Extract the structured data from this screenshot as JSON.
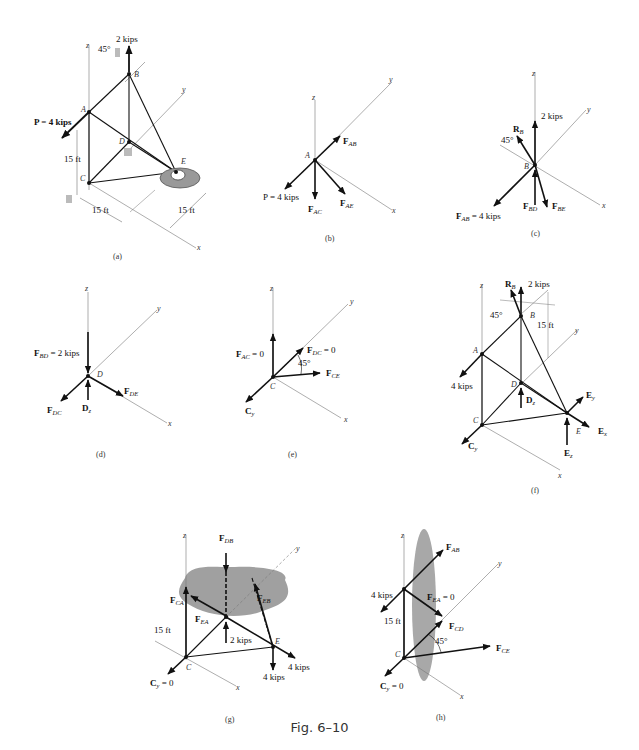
{
  "figure": {
    "caption": "Fig. 6–10",
    "panels": [
      {
        "id": "a",
        "label": "(a)",
        "elements": {
          "load_top": "2 kips",
          "angle": "45°",
          "load_P": "P = 4 kips",
          "dim_height": "15 ft",
          "dim_x": "15 ft",
          "dim_y": "15 ft",
          "joints": [
            "A",
            "B",
            "C",
            "D",
            "E"
          ],
          "axes": [
            "x",
            "y",
            "z"
          ]
        }
      },
      {
        "id": "b",
        "label": "(b)",
        "elements": {
          "joint": "A",
          "forces": [
            "F_AB",
            "F_AC",
            "F_AE"
          ],
          "load": "P = 4 kips"
        }
      },
      {
        "id": "c",
        "label": "(c)",
        "elements": {
          "joint": "B",
          "load": "2 kips",
          "reaction": "R_B",
          "angle": "45°",
          "forces": [
            "F_AB = 4 kips",
            "F_BD",
            "F_BE"
          ]
        }
      },
      {
        "id": "d",
        "label": "(d)",
        "elements": {
          "joint": "D",
          "forces": [
            "F_BD = 2 kips",
            "F_DC",
            "F_DE"
          ],
          "reaction": "D_z"
        }
      },
      {
        "id": "e",
        "label": "(e)",
        "elements": {
          "joint": "C",
          "forces": [
            "F_AC = 0",
            "F_DC = 0",
            "F_CE"
          ],
          "angle": "45°",
          "reaction": "C_y"
        }
      },
      {
        "id": "f",
        "label": "(f)",
        "elements": {
          "load_top": "2 kips",
          "reaction_B": "R_B",
          "angle": "45°",
          "dim": "15 ft",
          "load_A": "4 kips",
          "reactions": [
            "D_z",
            "C_y",
            "E_x",
            "E_y",
            "E_z"
          ]
        }
      },
      {
        "id": "g",
        "label": "(g)",
        "elements": {
          "forces": [
            "F_DB",
            "F_CA",
            "F_EB",
            "F_EA"
          ],
          "loads": [
            "2 kips",
            "4 kips",
            "4 kips"
          ],
          "dim": "15 ft",
          "reaction": "C_y = 0",
          "joints": [
            "C",
            "E"
          ]
        }
      },
      {
        "id": "h",
        "label": "(h)",
        "elements": {
          "forces": [
            "F_AB",
            "F_EA = 0",
            "F_CD",
            "F_CE"
          ],
          "load": "4 kips",
          "dim": "15 ft",
          "angle": "45°",
          "reaction": "C_y = 0",
          "joint": "C"
        }
      }
    ]
  },
  "text": {
    "a_2kips": "2 kips",
    "a_45": "45°",
    "a_P": "P = 4 kips",
    "a_15h": "15 ft",
    "a_15x": "15 ft",
    "a_15y": "15 ft",
    "b_P": "P = 4 kips",
    "c_2kips": "2 kips",
    "c_45": "45°",
    "c_FAB": " = 4 kips",
    "d_FBD": " = 2 kips",
    "e_FAC": " = 0",
    "e_FDC": " = 0",
    "e_45": "45°",
    "f_2kips": "2 kips",
    "f_45": "45°",
    "f_15": "15 ft",
    "f_4kips": "4 kips",
    "g_15": "15 ft",
    "g_2kips": "2 kips",
    "g_4a": "4 kips",
    "g_4b": "4 kips",
    "g_Cy": " = 0",
    "h_4kips": "4 kips",
    "h_15": "15 ft",
    "h_FEA": " = 0",
    "h_45": "45°",
    "h_Cy": " = 0",
    "cap_a": "(a)",
    "cap_b": "(b)",
    "cap_c": "(c)",
    "cap_d": "(d)",
    "cap_e": "(e)",
    "cap_f": "(f)",
    "cap_g": "(g)",
    "cap_h": "(h)"
  }
}
